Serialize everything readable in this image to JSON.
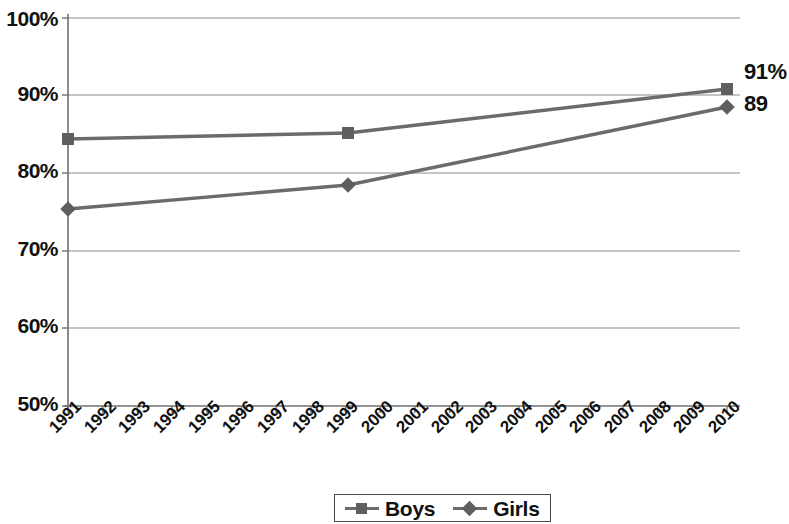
{
  "chart_data": {
    "type": "line",
    "title": "",
    "xlabel": "",
    "ylabel": "",
    "ylim": [
      50,
      100
    ],
    "y_ticks": [
      "50%",
      "60%",
      "70%",
      "80%",
      "90%",
      "100%"
    ],
    "y_tick_values": [
      50,
      60,
      70,
      80,
      90,
      100
    ],
    "grid": "horizontal",
    "legend_position": "bottom",
    "categories": [
      "1991",
      "1992",
      "1993",
      "1994",
      "1995",
      "1996",
      "1997",
      "1998",
      "1999",
      "2000",
      "2001",
      "2002",
      "2003",
      "2004",
      "2005",
      "2006",
      "2007",
      "2008",
      "2009",
      "2010"
    ],
    "series": [
      {
        "name": "Boys",
        "marker": "square",
        "color": "#6b6b6b",
        "x": [
          "1991",
          "1999",
          "2010"
        ],
        "values": [
          84.3,
          85.1,
          90.8
        ]
      },
      {
        "name": "Girls",
        "marker": "diamond",
        "color": "#6b6b6b",
        "x": [
          "1991",
          "1999",
          "2010"
        ],
        "values": [
          75.4,
          78.4,
          88.5
        ]
      }
    ],
    "annotations": [
      {
        "text": "91%",
        "series": "Boys",
        "x": "2010",
        "value": 90.8
      },
      {
        "text": "89",
        "series": "Girls",
        "x": "2010",
        "value": 88.5
      }
    ]
  },
  "axis": {
    "y_labels": [
      "100%",
      "90%",
      "80%",
      "70%",
      "60%",
      "50%"
    ],
    "x_labels": [
      "1991",
      "1992",
      "1993",
      "1994",
      "1995",
      "1996",
      "1997",
      "1998",
      "1999",
      "2000",
      "2001",
      "2002",
      "2003",
      "2004",
      "2005",
      "2006",
      "2007",
      "2008",
      "2009",
      "2010"
    ]
  },
  "legend": {
    "items": [
      {
        "label": "Boys",
        "marker": "square-marker-icon"
      },
      {
        "label": "Girls",
        "marker": "diamond-marker-icon"
      }
    ]
  },
  "labels": {
    "boys_end": "91%",
    "girls_end": "89"
  },
  "colors": {
    "line": "#6b6b6b",
    "marker": "#5f5f5f",
    "grid": "#8a8a8a",
    "axis": "#6f6f6f",
    "text": "#111111",
    "background": "#ffffff"
  }
}
